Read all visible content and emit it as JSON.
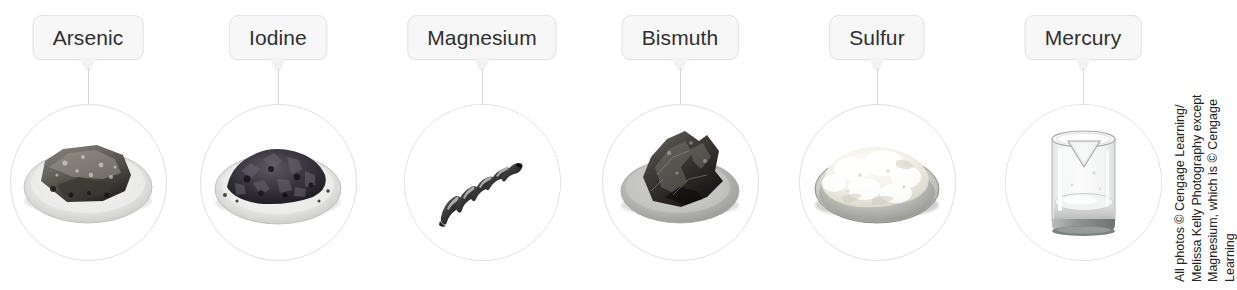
{
  "figure": {
    "background_color": "#ffffff",
    "width": 1237,
    "height": 290,
    "label_box_fill": "#f7f7f7",
    "label_box_border": "#e3e3e3",
    "label_text_color": "#2f3033",
    "leader_line_color": "#d8d8d8",
    "circle_border_color": "#e0e0e0"
  },
  "specimens": [
    {
      "label": "Arsenic",
      "icon": "petri-dish-arsenic-lump-photo",
      "center_x": 88,
      "circle_center_y": 182,
      "circle_diameter": 155,
      "description": "Gray metallic arsenic lump on a petri dish"
    },
    {
      "label": "Iodine",
      "icon": "petri-dish-iodine-crystals-photo",
      "center_x": 278,
      "circle_center_y": 182,
      "circle_diameter": 155,
      "description": "Dark purple-black iodine crystal flakes on a petri dish"
    },
    {
      "label": "Magnesium",
      "icon": "magnesium-ribbon-coil-photo",
      "center_x": 482,
      "circle_center_y": 182,
      "circle_diameter": 155,
      "description": "Coiled magnesium ribbon on a white background"
    },
    {
      "label": "Bismuth",
      "icon": "petri-dish-bismuth-crystal-photo",
      "center_x": 680,
      "circle_center_y": 182,
      "circle_diameter": 155,
      "description": "Dark iridescent bismuth crystal chunk on a petri dish"
    },
    {
      "label": "Sulfur",
      "icon": "petri-dish-sulfur-powder-photo",
      "center_x": 877,
      "circle_center_y": 182,
      "circle_diameter": 155,
      "description": "Pale yellow sulfur powder in a petri dish"
    },
    {
      "label": "Mercury",
      "icon": "beaker-mercury-liquid-photo",
      "center_x": 1083,
      "circle_center_y": 182,
      "circle_diameter": 155,
      "description": "Glass beaker holding liquid mercury"
    }
  ],
  "credit": {
    "lines": [
      "All photos © Cengage Learning/",
      "Melissa Kelly Photography except",
      "Magnesium, which is © Cengage",
      "Learning"
    ],
    "rotation": "-90deg",
    "color": "#232323"
  }
}
